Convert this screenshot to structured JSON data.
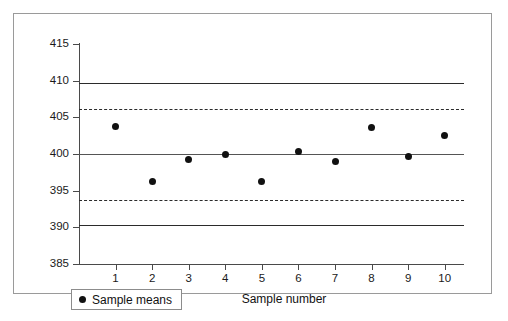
{
  "chart_data": {
    "type": "scatter",
    "title": "",
    "subtitle": "",
    "xlabel": "Sample number",
    "ylabel": "",
    "categories": [
      "1",
      "2",
      "3",
      "4",
      "5",
      "6",
      "7",
      "8",
      "9",
      "10"
    ],
    "x": [
      1,
      2,
      3,
      4,
      5,
      6,
      7,
      8,
      9,
      10
    ],
    "series": [
      {
        "name": "Sample means",
        "values": [
          403.8,
          396.2,
          399.3,
          400.0,
          396.2,
          400.4,
          399.0,
          403.6,
          399.6,
          402.5
        ]
      }
    ],
    "ylim": [
      385,
      415
    ],
    "xlim": [
      0,
      10.5
    ],
    "y_ticks": [
      385,
      390,
      395,
      400,
      405,
      410,
      415
    ],
    "y_tick_labels": [
      "385",
      "390",
      "395",
      "400",
      "405",
      "410",
      "415"
    ],
    "x_ticks": [
      1,
      2,
      3,
      4,
      5,
      6,
      7,
      8,
      9,
      10
    ],
    "x_tick_labels": [
      "1",
      "2",
      "3",
      "4",
      "5",
      "6",
      "7",
      "8",
      "9",
      "10"
    ],
    "grid": false,
    "legend_position": "bottom-left",
    "marker_color": "#111111",
    "control_lines": [
      {
        "name": "upper-control-limit",
        "value": 409.7,
        "style": "solid",
        "color": "#2b2b2b"
      },
      {
        "name": "upper-warning-limit",
        "value": 406.2,
        "style": "dashed",
        "color": "#2b2b2b"
      },
      {
        "name": "center-line",
        "value": 400.0,
        "style": "solid",
        "color": "#555555"
      },
      {
        "name": "lower-warning-limit",
        "value": 393.7,
        "style": "dashed",
        "color": "#2b2b2b"
      },
      {
        "name": "lower-control-limit",
        "value": 390.3,
        "style": "solid",
        "color": "#2b2b2b"
      }
    ]
  },
  "legend": {
    "entry_label": "Sample means",
    "marker": "filled-circle"
  },
  "axes": {
    "x_title": "Sample number"
  },
  "figure": {
    "border_color": "#9a9a9a",
    "background": "#ffffff"
  }
}
